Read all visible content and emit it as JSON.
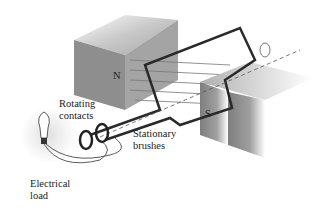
{
  "diagram": {
    "type": "ac-generator",
    "labels": {
      "north_pole": "N",
      "south_pole": "S",
      "rotating_contacts": [
        "Rotating",
        "contacts"
      ],
      "stationary_brushes": [
        "Stationary",
        "brushes"
      ],
      "electrical_load": [
        "Electrical",
        "load"
      ]
    },
    "colors": {
      "magnet_face": "#8c8c8c",
      "magnet_top": "#b8b8b8",
      "coil": "#2a2a2a",
      "field_lines": "#777777"
    }
  }
}
